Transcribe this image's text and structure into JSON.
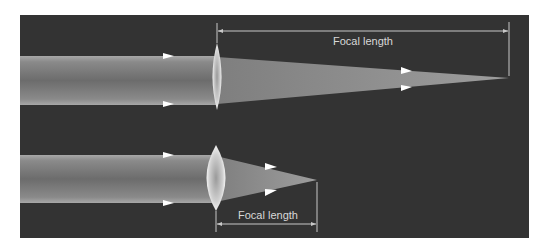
{
  "figure": {
    "background_color": "#333333",
    "beam_edge_color": "#a0a0a0",
    "beam_core_color": "#6e6e6e",
    "lens_color": "#e8e8e8",
    "annotation_color": "#c8c8c8"
  },
  "diagrams": [
    {
      "id": "weak-lens",
      "lens_type": "thin converging lens",
      "incoming_arrows": 2,
      "outgoing_arrows": 2,
      "focal_length_label": "Focal length",
      "annotation_position": "above"
    },
    {
      "id": "strong-lens",
      "lens_type": "thick converging lens",
      "incoming_arrows": 2,
      "outgoing_arrows": 2,
      "focal_length_label": "Focal length",
      "annotation_position": "below"
    }
  ]
}
